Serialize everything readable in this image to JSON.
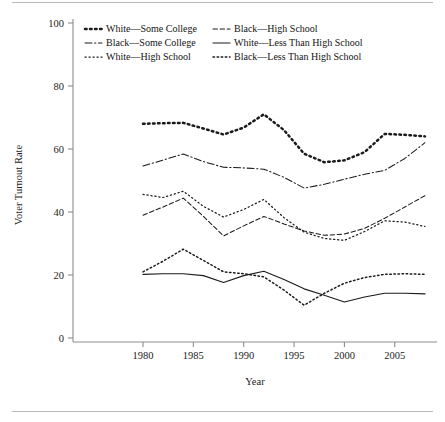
{
  "figure": {
    "name": "voter-turnout-by-race-education",
    "axis_titles": {
      "x": "Year",
      "y": "Voter Turnout Rate"
    }
  },
  "chart_data": {
    "type": "line",
    "title": "",
    "xlabel": "Year",
    "ylabel": "Voter Turnout Rate",
    "xlim": [
      1980,
      2008
    ],
    "ylim": [
      0,
      100
    ],
    "xticks": [
      1980,
      1985,
      1990,
      1995,
      2000,
      2005
    ],
    "yticks": [
      0,
      20,
      40,
      60,
      80,
      100
    ],
    "grid": false,
    "legend_position": "top-inside",
    "x": [
      1980,
      1982,
      1984,
      1986,
      1988,
      1990,
      1992,
      1994,
      1996,
      1998,
      2000,
      2002,
      2004,
      2006,
      2008
    ],
    "series": [
      {
        "name": "White—Some College",
        "style": "dotted-bold",
        "color": "#1b1b1b",
        "values": [
          68.0,
          68.2,
          68.3,
          66.5,
          64.6,
          66.8,
          71.0,
          66.0,
          58.5,
          55.8,
          56.4,
          59.0,
          64.8,
          64.5,
          64.0
        ]
      },
      {
        "name": "Black—Some College",
        "style": "dash-dot",
        "color": "#1b1b1b",
        "values": [
          54.6,
          56.5,
          58.4,
          56.0,
          54.2,
          54.0,
          53.6,
          51.0,
          47.6,
          48.8,
          50.4,
          52.0,
          53.2,
          57.0,
          62.0
        ]
      },
      {
        "name": "White—High School",
        "style": "dotted-fine",
        "color": "#1b1b1b",
        "values": [
          45.6,
          44.6,
          46.6,
          41.8,
          38.4,
          40.8,
          44.0,
          38.2,
          33.6,
          31.6,
          31.0,
          33.8,
          37.2,
          36.8,
          35.4
        ]
      },
      {
        "name": "Black—High School",
        "style": "dashed",
        "color": "#1b1b1b",
        "values": [
          39.0,
          41.6,
          44.4,
          38.6,
          32.4,
          35.6,
          38.6,
          36.2,
          34.0,
          32.6,
          33.0,
          34.8,
          38.0,
          41.6,
          45.2
        ]
      },
      {
        "name": "White—Less Than High School",
        "style": "solid",
        "color": "#3d3d3d",
        "values": [
          20.2,
          20.4,
          20.4,
          19.8,
          17.6,
          19.8,
          21.2,
          18.6,
          15.6,
          13.6,
          11.4,
          13.0,
          14.2,
          14.2,
          14.0
        ]
      },
      {
        "name": "Black—Less Than High School",
        "style": "dotted-medium",
        "color": "#3d3d3d",
        "values": [
          21.0,
          24.4,
          28.2,
          24.6,
          21.0,
          20.4,
          19.4,
          15.2,
          10.4,
          14.2,
          17.4,
          19.2,
          20.2,
          20.4,
          20.2
        ]
      }
    ]
  },
  "legend": {
    "entries": [
      {
        "label": "White—Some College",
        "style": "dotted-bold"
      },
      {
        "label": "Black—High School",
        "style": "dashed"
      },
      {
        "label": "Black—Some College",
        "style": "dash-dot"
      },
      {
        "label": "White—Less Than High School",
        "style": "solid"
      },
      {
        "label": "White—High School",
        "style": "dotted-fine"
      },
      {
        "label": "Black—Less Than High School",
        "style": "dotted-medium"
      }
    ]
  }
}
